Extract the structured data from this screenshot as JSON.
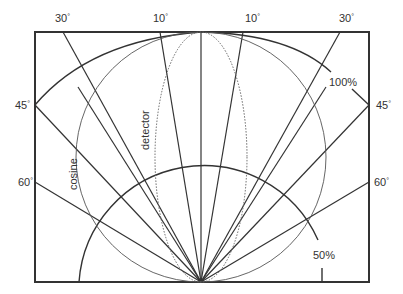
{
  "diagram": {
    "title": "",
    "origin": {
      "x": 201,
      "y": 282
    },
    "frame": {
      "x": 35,
      "y": 32,
      "width": 334,
      "height": 250
    },
    "colors": {
      "line": "#333333",
      "thin": "#555555",
      "dotted": "#666666",
      "text": "#333333",
      "background": "#ffffff"
    },
    "angle_labels": [
      {
        "id": "top-left-30",
        "text": "30",
        "unit": "°",
        "x": 55,
        "y": 22
      },
      {
        "id": "top-left-10",
        "text": "10",
        "unit": "°",
        "x": 153,
        "y": 22
      },
      {
        "id": "top-right-10",
        "text": "10",
        "unit": "°",
        "x": 245,
        "y": 22
      },
      {
        "id": "top-right-30",
        "text": "30",
        "unit": "°",
        "x": 339,
        "y": 22
      },
      {
        "id": "left-45",
        "text": "45",
        "unit": "°",
        "x": 15,
        "y": 108
      },
      {
        "id": "right-45",
        "text": "45",
        "unit": "°",
        "x": 376,
        "y": 108
      },
      {
        "id": "left-60",
        "text": "60",
        "unit": "°",
        "x": 18,
        "y": 185
      },
      {
        "id": "right-60",
        "text": "60",
        "unit": "°",
        "x": 374,
        "y": 185
      }
    ],
    "curve_labels": {
      "full": "100%",
      "half": "50%",
      "cosine": "cosine",
      "detector": "detector"
    },
    "ray_angles_deg": [
      -60,
      -45,
      -30,
      -20,
      -10,
      0,
      10,
      20,
      30,
      45,
      60
    ],
    "curves": [
      {
        "name": "100% intensity arc",
        "radius": 250
      },
      {
        "name": "50% intensity arc",
        "radius": 125
      },
      {
        "name": "cosine circle",
        "center": [
          201,
          157
        ],
        "radius": 125
      },
      {
        "name": "detector ellipse",
        "center": [
          201,
          157
        ],
        "rx": 46,
        "ry": 125,
        "style": "dotted"
      }
    ]
  }
}
